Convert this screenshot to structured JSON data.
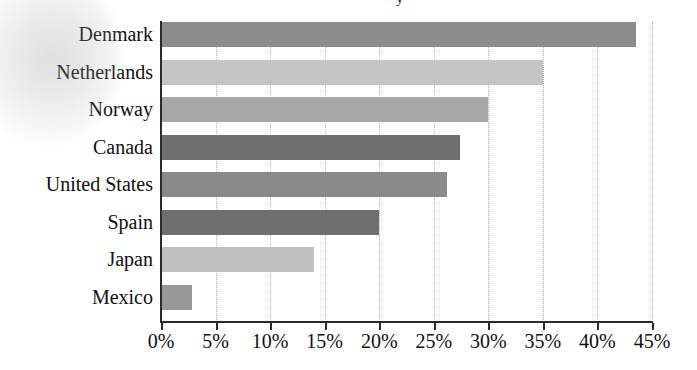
{
  "chart_data": {
    "type": "bar",
    "orientation": "horizontal",
    "title": "",
    "xlabel": "",
    "ylabel": "",
    "categories": [
      "Denmark",
      "Netherlands",
      "Norway",
      "Canada",
      "United States",
      "Spain",
      "Japan",
      "Mexico"
    ],
    "values": [
      43.5,
      35.0,
      30.0,
      27.4,
      26.2,
      20.0,
      14.0,
      2.8
    ],
    "value_suffix": "%",
    "xlim": [
      0,
      45
    ],
    "xticks": [
      0,
      5,
      10,
      15,
      20,
      25,
      30,
      35,
      40,
      45
    ],
    "xtick_labels": [
      "0%",
      "5%",
      "10%",
      "15%",
      "20%",
      "25%",
      "30%",
      "35%",
      "40%",
      "45%"
    ],
    "grid": true,
    "grid_axis": "x",
    "grid_style": "dotted",
    "legend": false,
    "bar_colors": [
      "#8d8d8d",
      "#c5c5c5",
      "#a8a8a8",
      "#6f6f6f",
      "#8a8a8a",
      "#6f6f6f",
      "#c0c0c0",
      "#989898"
    ],
    "axis_color": "#2b2b2b",
    "grid_color": "#b9b9b9",
    "text_color": "#101010",
    "background": "#ffffff",
    "series": [
      {
        "name": "",
        "points": [
          {
            "category": "Denmark",
            "value": 43.5,
            "label": "43.5%",
            "color": "#8d8d8d"
          },
          {
            "category": "Netherlands",
            "value": 35.0,
            "label": "35%",
            "color": "#c5c5c5"
          },
          {
            "category": "Norway",
            "value": 30.0,
            "label": "30%",
            "color": "#a8a8a8"
          },
          {
            "category": "Canada",
            "value": 27.4,
            "label": "27.4%",
            "color": "#6f6f6f"
          },
          {
            "category": "United States",
            "value": 26.2,
            "label": "26.2%",
            "color": "#8a8a8a"
          },
          {
            "category": "Spain",
            "value": 20.0,
            "label": "20%",
            "color": "#6f6f6f"
          },
          {
            "category": "Japan",
            "value": 14.0,
            "label": "14%",
            "color": "#c0c0c0"
          },
          {
            "category": "Mexico",
            "value": 2.8,
            "label": "2.8%",
            "color": "#989898"
          }
        ]
      }
    ]
  },
  "title_fragment": "y"
}
